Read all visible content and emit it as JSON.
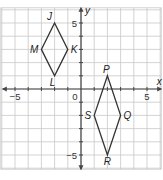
{
  "chart_data": {
    "type": "coordinate-grid",
    "title": "",
    "xlabel": "x",
    "ylabel": "y",
    "xlim": [
      -6,
      6
    ],
    "ylim": [
      -6,
      6
    ],
    "grid": true,
    "tick_labels": {
      "x": [
        {
          "value": -5,
          "label": "−5"
        },
        {
          "value": 0,
          "label": "0"
        },
        {
          "value": 5,
          "label": "5"
        }
      ],
      "y": [
        {
          "value": 5,
          "label": "5"
        },
        {
          "value": -5,
          "label": "−5"
        }
      ]
    },
    "shapes": [
      {
        "name": "rhombus-JKLM",
        "vertices": [
          {
            "label": "J",
            "x": -2,
            "y": 5
          },
          {
            "label": "K",
            "x": -1,
            "y": 3
          },
          {
            "label": "L",
            "x": -2,
            "y": 1
          },
          {
            "label": "M",
            "x": -3,
            "y": 3
          }
        ]
      },
      {
        "name": "rhombus-PQRS",
        "vertices": [
          {
            "label": "P",
            "x": 2,
            "y": 1
          },
          {
            "label": "Q",
            "x": 3,
            "y": -2
          },
          {
            "label": "R",
            "x": 2,
            "y": -5
          },
          {
            "label": "S",
            "x": 1,
            "y": -2
          }
        ]
      }
    ]
  },
  "colors": {
    "grid": "#c8c8c8",
    "axis": "#444444",
    "shape": "#333333",
    "background": "#ffffff"
  }
}
